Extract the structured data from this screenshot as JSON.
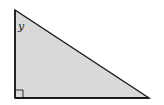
{
  "diagram": {
    "type": "right-triangle",
    "fill_color": "#d9d9d9",
    "stroke_color": "#1a1a1a",
    "angle_label": "y",
    "right_angle_marker": true
  }
}
